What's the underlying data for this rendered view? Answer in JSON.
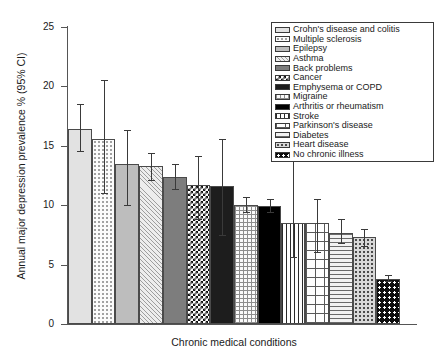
{
  "chart_data": {
    "type": "bar",
    "title": "",
    "xlabel": "Chronic medical conditions",
    "ylabel": "Annual major depression prevalence % (95% CI)",
    "ylim": [
      0,
      25
    ],
    "yticks": [
      0,
      5,
      10,
      15,
      20,
      25
    ],
    "grid": false,
    "legend_position": "top-right",
    "categories": [
      "Crohn's disease and colitis",
      "Multiple sclerosis",
      "Epilepsy",
      "Asthma",
      "Back problems",
      "Cancer",
      "Emphysema or COPD",
      "Migraine",
      "Arthritis or rheumatism",
      "Stroke",
      "Parkinson's disease",
      "Diabetes",
      "Heart disease",
      "No chronic illness"
    ],
    "values": [
      16.4,
      15.6,
      13.5,
      13.3,
      12.4,
      11.7,
      11.6,
      10.0,
      9.9,
      8.5,
      8.5,
      7.7,
      7.3,
      3.8
    ],
    "ci_low": [
      14.6,
      11.0,
      10.0,
      12.1,
      11.4,
      8.8,
      7.5,
      9.4,
      9.4,
      5.6,
      6.1,
      6.8,
      6.6,
      3.6
    ],
    "ci_high": [
      18.5,
      20.5,
      16.3,
      14.4,
      13.5,
      14.1,
      15.6,
      10.7,
      10.5,
      13.9,
      10.5,
      8.8,
      8.0,
      4.1
    ],
    "patterns": [
      "p-solidLight",
      "p-dotSparse",
      "p-solidMid",
      "p-diagThin",
      "p-solidDark",
      "p-checker",
      "p-black",
      "p-grid",
      "p-pureBlack",
      "p-vert",
      "p-brick",
      "p-horiz",
      "p-dotMid",
      "p-dotBlack"
    ]
  },
  "legend": {
    "items": [
      {
        "label": "Crohn's disease and colitis"
      },
      {
        "label": "Multiple sclerosis"
      },
      {
        "label": "Epilepsy"
      },
      {
        "label": "Asthma"
      },
      {
        "label": "Back problems"
      },
      {
        "label": "Cancer"
      },
      {
        "label": "Emphysema or COPD"
      },
      {
        "label": "Migraine"
      },
      {
        "label": "Arthritis or rheumatism"
      },
      {
        "label": "Stroke"
      },
      {
        "label": "Parkinson's disease"
      },
      {
        "label": "Diabetes"
      },
      {
        "label": "Heart disease"
      },
      {
        "label": "No chronic illness"
      }
    ]
  },
  "colors": {
    "axis": "#555555",
    "text": "#1a1a1a",
    "background": "#ffffff",
    "error_bar": "#3a3a3a"
  }
}
